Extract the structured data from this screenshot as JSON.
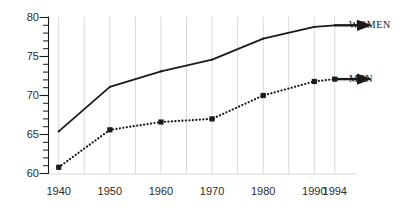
{
  "chart_data": {
    "type": "line",
    "title": "",
    "subtitle": "",
    "xlabel": "",
    "ylabel": "",
    "x": [
      1940,
      1950,
      1960,
      1970,
      1980,
      1990,
      1994
    ],
    "xlim": [
      1938,
      1996
    ],
    "ylim": [
      60,
      80
    ],
    "grid": "vertical-only",
    "legend_position": "right-inline-end-of-line",
    "xticks": [
      1940,
      1950,
      1960,
      1970,
      1980,
      1990,
      1994
    ],
    "xtick_labels": [
      "1940",
      "1950",
      "1960",
      "1970",
      "1980",
      "1990",
      "1994"
    ],
    "gridline_years": [
      1940,
      1945,
      1950,
      1955,
      1960,
      1965,
      1970,
      1975,
      1980,
      1985,
      1990,
      1994
    ],
    "yticks": [
      60,
      65,
      70,
      75,
      80
    ],
    "ytick_labels": [
      "60",
      "65",
      "70",
      "75",
      "80"
    ],
    "yminor_step": 1,
    "series": [
      {
        "name": "WOMEN",
        "label": "WOMEN",
        "style": "solid",
        "color": "#1a1a1a",
        "marker": "none",
        "arrow_end": true,
        "values": [
          65.4,
          71.1,
          73.1,
          74.6,
          77.3,
          78.8,
          79.0
        ]
      },
      {
        "name": "MEN",
        "label": "MEN",
        "style": "dotted",
        "color": "#1a1a1a",
        "marker": "square",
        "arrow_end": true,
        "values": [
          60.8,
          65.6,
          66.6,
          67.0,
          70.0,
          71.8,
          72.1
        ]
      }
    ]
  },
  "axis_colors": {
    "axis_line": "#1a1a1a",
    "gridline": "#d9d9dd",
    "tick_text": "#2b2b2b"
  }
}
